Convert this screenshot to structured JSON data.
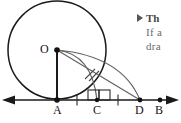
{
  "figure": {
    "kind": "geometry-diagram",
    "stroke_color": "#1a1a1a",
    "arc_color": "#5f5f5f",
    "background": "#ffffff",
    "baseline_y": 100,
    "circle": {
      "center_label": "O",
      "cx": 57,
      "cy": 50,
      "r": 49
    },
    "points": [
      {
        "label": "O",
        "x": 57,
        "y": 50,
        "filled": true
      },
      {
        "label": "A",
        "x": 57,
        "y": 100,
        "filled": true
      },
      {
        "label": "C",
        "x": 97,
        "y": 100,
        "filled": true
      },
      {
        "label": "D",
        "x": 140,
        "y": 100,
        "filled": true
      },
      {
        "label": "B",
        "x": 160,
        "y": 100,
        "filled": true
      }
    ],
    "tick_marks_on_baseline": [
      {
        "x": 77
      },
      {
        "x": 118
      }
    ],
    "hash_marks_label": "congruent-segment-hatch",
    "right_angle_at": "C",
    "segments": [
      {
        "name": "OA",
        "from": "O",
        "to": "A"
      },
      {
        "name": "OD",
        "from": "O",
        "to": "D"
      }
    ],
    "arcs": [
      {
        "name": "inner-arc",
        "from": "O",
        "to": "C"
      },
      {
        "name": "outer-arc",
        "from": "O",
        "to": "D"
      }
    ]
  },
  "labels": {
    "O": "O",
    "A": "A",
    "C": "C",
    "D": "D",
    "B": "B"
  },
  "note": {
    "bullet_icon": "right-triangle-bullet",
    "title": "Th",
    "line2": "If a",
    "line3": "dra"
  }
}
